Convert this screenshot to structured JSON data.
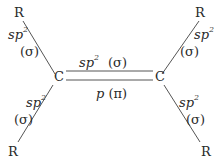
{
  "diagram": {
    "atoms": {
      "carbon_left": "C",
      "carbon_right": "C",
      "r_top_left": "R",
      "r_top_right": "R",
      "r_bottom_left": "R",
      "r_bottom_right": "R"
    },
    "bond_labels": {
      "hybrid_base": "sp",
      "hybrid_sup": "2",
      "sigma": "(σ)",
      "p_orbital": "p",
      "pi": "(π)"
    },
    "colors": {
      "line": "#555555",
      "text": "#2a2a2a",
      "background": "#ffffff"
    }
  }
}
